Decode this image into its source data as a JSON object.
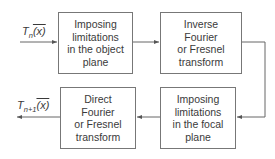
{
  "diagram": {
    "type": "iterative-algorithm-flowchart",
    "input_label": {
      "symbol": "T",
      "subscript": "n",
      "arg": "(x)",
      "arg_vector": "x"
    },
    "output_label": {
      "symbol": "T",
      "subscript": "n+1",
      "arg": "(x)",
      "arg_vector": "x"
    },
    "boxes": [
      {
        "id": "object-plane",
        "lines": [
          "Imposing",
          "limitations",
          "in the object",
          "plane"
        ]
      },
      {
        "id": "inverse-transform",
        "lines": [
          "Inverse",
          "Fourier",
          "or Fresnel",
          "transform"
        ]
      },
      {
        "id": "focal-plane",
        "lines": [
          "Imposing",
          "limitations",
          "in the focal",
          "plane"
        ]
      },
      {
        "id": "direct-transform",
        "lines": [
          "Direct",
          "Fourier",
          "or Fresnel",
          "transform"
        ]
      }
    ],
    "edges": [
      {
        "from": "input",
        "to": "object-plane"
      },
      {
        "from": "object-plane",
        "to": "inverse-transform"
      },
      {
        "from": "inverse-transform",
        "to": "focal-plane"
      },
      {
        "from": "focal-plane",
        "to": "direct-transform"
      },
      {
        "from": "direct-transform",
        "to": "output"
      }
    ],
    "colors": {
      "line": "#666666",
      "text": "#3a3a3a",
      "background": "#ffffff"
    }
  }
}
